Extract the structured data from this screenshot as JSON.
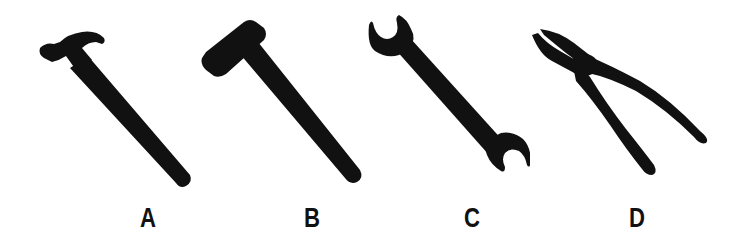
{
  "figure": {
    "background": "#ffffff",
    "ink_color": "#111111",
    "tools": [
      {
        "id": "A",
        "label": "A",
        "name": "claw hammer",
        "icon": "claw-hammer-icon"
      },
      {
        "id": "B",
        "label": "B",
        "name": "sledge / mallet hammer",
        "icon": "mallet-icon"
      },
      {
        "id": "C",
        "label": "C",
        "name": "open-end wrench",
        "icon": "wrench-icon"
      },
      {
        "id": "D",
        "label": "D",
        "name": "pliers",
        "icon": "pliers-icon"
      }
    ]
  }
}
